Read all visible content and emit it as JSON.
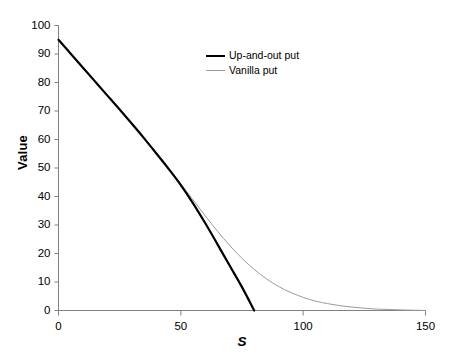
{
  "chart_data": {
    "type": "line",
    "title": "",
    "xlabel": "S",
    "ylabel": "Value",
    "xlim": [
      0,
      150
    ],
    "ylim": [
      0,
      100
    ],
    "xticks": [
      0,
      50,
      100,
      150
    ],
    "yticks": [
      0,
      10,
      20,
      30,
      40,
      50,
      60,
      70,
      80,
      90,
      100
    ],
    "xtick_labels": [
      "0",
      "50",
      "100",
      "150"
    ],
    "ytick_labels": [
      "0",
      "10",
      "20",
      "30",
      "40",
      "50",
      "60",
      "70",
      "80",
      "90",
      "100"
    ],
    "grid": false,
    "legend_position": "upper-center",
    "x": [
      0,
      5,
      10,
      15,
      20,
      25,
      30,
      35,
      40,
      45,
      50,
      55,
      60,
      65,
      70,
      75,
      80,
      85,
      90,
      95,
      100,
      105,
      110,
      115,
      120,
      125,
      130,
      135,
      140,
      145,
      150
    ],
    "series": [
      {
        "name": "Up-and-out put",
        "color": "#000000",
        "line_width": 2.2,
        "values": [
          95.0,
          90.1,
          85.2,
          80.3,
          75.4,
          70.5,
          65.5,
          60.4,
          55.1,
          49.7,
          44.0,
          37.6,
          30.6,
          23.2,
          15.7,
          8.2,
          0.0,
          null,
          null,
          null,
          null,
          null,
          null,
          null,
          null,
          null,
          null,
          null,
          null,
          null,
          null
        ]
      },
      {
        "name": "Vanilla put",
        "color": "#9a9a9a",
        "line_width": 1.0,
        "values": [
          95.0,
          90.1,
          85.2,
          80.3,
          75.4,
          70.5,
          65.6,
          60.6,
          55.4,
          50.0,
          44.4,
          38.8,
          33.2,
          27.8,
          22.8,
          18.3,
          14.4,
          11.1,
          8.4,
          6.3,
          4.6,
          3.3,
          2.4,
          1.7,
          1.2,
          0.8,
          0.5,
          0.35,
          0.2,
          0.1,
          0.0
        ]
      }
    ],
    "annotations": {
      "barrier_s": 80,
      "note": "Up-and-out put knocks out at the barrier S=80"
    }
  },
  "legend": {
    "items": [
      {
        "label": "Up-and-out put",
        "style": "thick"
      },
      {
        "label": "Vanilla put",
        "style": "thin"
      }
    ]
  },
  "axes": {
    "y_title": "Value",
    "x_title": "S"
  },
  "colors": {
    "axis": "#808080",
    "series_primary": "#000000",
    "series_secondary": "#9a9a9a",
    "background": "#ffffff"
  }
}
